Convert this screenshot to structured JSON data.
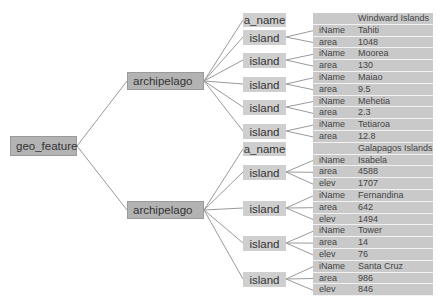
{
  "root": {
    "label": "geo_feature"
  },
  "archipelagos": [
    {
      "label": "archipelago",
      "a_name_label": "a_name",
      "name": "Windward Islands",
      "islands": [
        {
          "label": "island",
          "attrs": [
            {
              "k": "iName",
              "v": "Tahiti"
            },
            {
              "k": "area",
              "v": "1048"
            }
          ]
        },
        {
          "label": "island",
          "attrs": [
            {
              "k": "iName",
              "v": "Moorea"
            },
            {
              "k": "area",
              "v": "130"
            }
          ]
        },
        {
          "label": "island",
          "attrs": [
            {
              "k": "iName",
              "v": "Maiao"
            },
            {
              "k": "area",
              "v": "9.5"
            }
          ]
        },
        {
          "label": "island",
          "attrs": [
            {
              "k": "iName",
              "v": "Mehetia"
            },
            {
              "k": "area",
              "v": "2.3"
            }
          ]
        },
        {
          "label": "island",
          "attrs": [
            {
              "k": "iName",
              "v": "Tetiaroa"
            },
            {
              "k": "area",
              "v": "12.8"
            }
          ]
        }
      ]
    },
    {
      "label": "archipelago",
      "a_name_label": "a_name",
      "name": "Galapagos Islands",
      "islands": [
        {
          "label": "island",
          "attrs": [
            {
              "k": "iName",
              "v": "Isabela"
            },
            {
              "k": "area",
              "v": "4588"
            },
            {
              "k": "elev",
              "v": "1707"
            }
          ]
        },
        {
          "label": "island",
          "attrs": [
            {
              "k": "iName",
              "v": "Fernandina"
            },
            {
              "k": "area",
              "v": "642"
            },
            {
              "k": "elev",
              "v": "1494"
            }
          ]
        },
        {
          "label": "island",
          "attrs": [
            {
              "k": "iName",
              "v": "Tower"
            },
            {
              "k": "area",
              "v": "14"
            },
            {
              "k": "elev",
              "v": "76"
            }
          ]
        },
        {
          "label": "island",
          "attrs": [
            {
              "k": "iName",
              "v": "Santa Cruz"
            },
            {
              "k": "area",
              "v": "986"
            },
            {
              "k": "elev",
              "v": "846"
            }
          ]
        }
      ]
    }
  ],
  "colors": {
    "dark_node": "#b3b3b3",
    "light_node": "#cfcfcf",
    "cell": "#c9c9c9",
    "edge": "#999999"
  }
}
